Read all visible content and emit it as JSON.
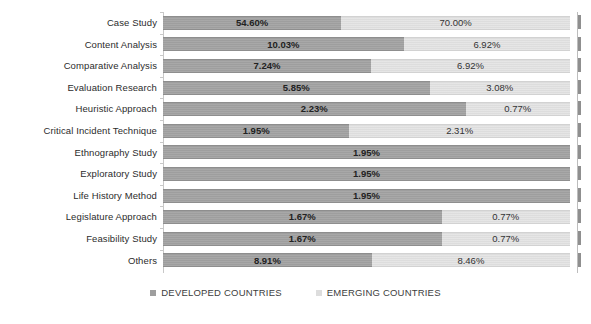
{
  "chart_data": {
    "type": "bar",
    "subtype": "100% stacked horizontal bar",
    "title": "",
    "xlabel": "",
    "ylabel": "",
    "grid": false,
    "legend_position": "bottom",
    "xlim": [
      0,
      100
    ],
    "categories": [
      "Case Study",
      "Content Analysis",
      "Comparative Analysis",
      "Evaluation Research",
      "Heuristic Approach",
      "Critical Incident Technique",
      "Ethnography Study",
      "Exploratory Study",
      "Life History Method",
      "Legislature Approach",
      "Feasibility Study",
      "Others"
    ],
    "series": [
      {
        "name": "DEVELOPED COUNTRIES",
        "color": "#9e9e9e",
        "values": [
          54.6,
          10.03,
          7.24,
          5.85,
          2.23,
          1.95,
          1.95,
          1.95,
          1.95,
          1.67,
          1.67,
          8.91
        ],
        "labels": [
          "54.60%",
          "10.03%",
          "7.24%",
          "5.85%",
          "2.23%",
          "1.95%",
          "1.95%",
          "1.95%",
          "1.95%",
          "1.67%",
          "1.67%",
          "8.91%"
        ]
      },
      {
        "name": "EMERGING COUNTRIES",
        "color": "#dddddd",
        "values": [
          70.0,
          6.92,
          6.92,
          3.08,
          0.77,
          2.31,
          0,
          0,
          0,
          0.77,
          0.77,
          8.46
        ],
        "labels": [
          "70.00%",
          "6.92%",
          "6.92%",
          "3.08%",
          "0.77%",
          "2.31%",
          "",
          "",
          "",
          "0.77%",
          "0.77%",
          "8.46%"
        ]
      }
    ]
  },
  "legend": {
    "items": [
      {
        "label": "DEVELOPED COUNTRIES",
        "swatch": "#9e9e9e"
      },
      {
        "label": "EMERGING COUNTRIES",
        "swatch": "#dddddd"
      }
    ]
  }
}
